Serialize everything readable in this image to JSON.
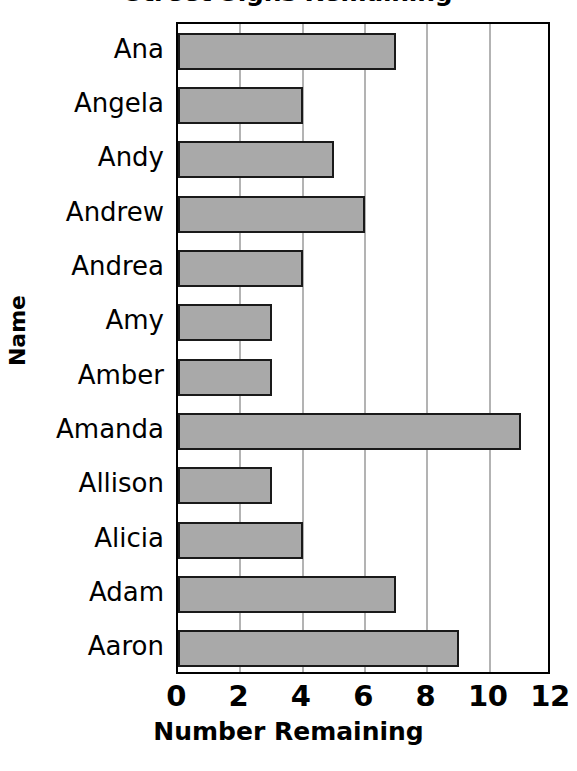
{
  "chart_data": {
    "type": "bar",
    "orientation": "horizontal",
    "title": "Street Signs Remaining",
    "xlabel": "Number Remaining",
    "ylabel": "Name",
    "xlim": [
      0,
      12
    ],
    "xticks": [
      0,
      2,
      4,
      6,
      8,
      10,
      12
    ],
    "xtick_labels": [
      "0",
      "2",
      "4",
      "6",
      "8",
      "10",
      "12"
    ],
    "grid": "vertical gridlines at 2, 4, 6, 8, 10",
    "legend": "none",
    "categories": [
      "Ana",
      "Angela",
      "Andy",
      "Andrew",
      "Andrea",
      "Amy",
      "Amber",
      "Amanda",
      "Allison",
      "Alicia",
      "Adam",
      "Aaron"
    ],
    "values": [
      7,
      4,
      5,
      6,
      4,
      3,
      3,
      11,
      3,
      4,
      7,
      9
    ],
    "bar_color": "#a9a9a9",
    "bar_edge_color": "#1a1a1a",
    "gridline_color": "#b3b3b3",
    "axis_color": "#000000",
    "background_color": "#ffffff"
  }
}
